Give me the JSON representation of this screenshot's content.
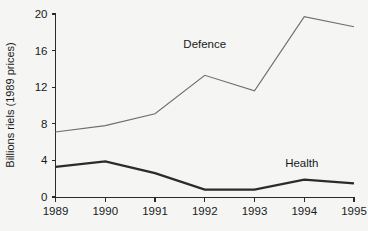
{
  "chart_data": {
    "type": "line",
    "title": "",
    "xlabel": "",
    "ylabel": "Billions riels (1989 prices)",
    "x": [
      1989,
      1990,
      1991,
      1992,
      1993,
      1994,
      1995
    ],
    "categories": [
      "1989",
      "1990",
      "1991",
      "1992",
      "1993",
      "1994",
      "1995"
    ],
    "series": [
      {
        "name": "Defence",
        "values": [
          7.1,
          7.8,
          9.1,
          13.3,
          11.6,
          19.7,
          18.6
        ],
        "color": "#6e6e6e"
      },
      {
        "name": "Health",
        "values": [
          3.3,
          3.9,
          2.6,
          0.8,
          0.8,
          1.9,
          1.5
        ],
        "color": "#2b2b2b"
      }
    ],
    "ylim": [
      0,
      20
    ],
    "xlim": [
      1989,
      1995
    ],
    "yticks": [
      0,
      4,
      8,
      12,
      16,
      20
    ],
    "ytick_labels": [
      "0",
      "4",
      "8",
      "12",
      "16",
      "20"
    ],
    "xtick_labels": [
      "1989",
      "1990",
      "1991",
      "1992",
      "1993",
      "1994",
      "1995"
    ],
    "grid": false,
    "legend_position": "inline-annotation",
    "annotations": [
      {
        "text": "Defence",
        "x": 1992.0,
        "y": 16.3
      },
      {
        "text": "Health",
        "x": 1993.95,
        "y": 3.3
      }
    ],
    "background_color": "#f5f5f3"
  }
}
